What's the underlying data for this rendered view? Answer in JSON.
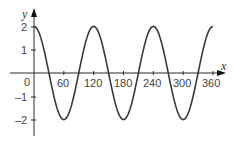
{
  "chart_data": {
    "type": "line",
    "title": "",
    "xlabel": "x",
    "ylabel": "y",
    "xlim": [
      0,
      370
    ],
    "ylim": [
      -2.6,
      2.8
    ],
    "grid": false,
    "legend": null,
    "x_ticks": [
      60,
      120,
      180,
      240,
      300,
      360
    ],
    "y_ticks": [
      2,
      1,
      -1,
      -2
    ],
    "origin_label": "0",
    "series": [
      {
        "name": "y = 2cos(3x)",
        "function": "2*cos(3x degrees)",
        "x": [
          0,
          30,
          60,
          90,
          120,
          150,
          180,
          210,
          240,
          270,
          300,
          330,
          360
        ],
        "values": [
          2,
          0,
          -2,
          0,
          2,
          0,
          -2,
          0,
          2,
          0,
          -2,
          0,
          2
        ]
      }
    ]
  },
  "colors": {
    "curve": "#3a3a3a",
    "axis": "#2a2a2a",
    "text": "#444444"
  },
  "labels": {
    "x_axis": "x",
    "y_axis": "y",
    "origin": "0",
    "xt0": "60",
    "xt1": "120",
    "xt2": "180",
    "xt3": "240",
    "xt4": "300",
    "xt5": "360",
    "yt0": "2",
    "yt1": "1",
    "yt2": "–1",
    "yt3": "–2"
  }
}
